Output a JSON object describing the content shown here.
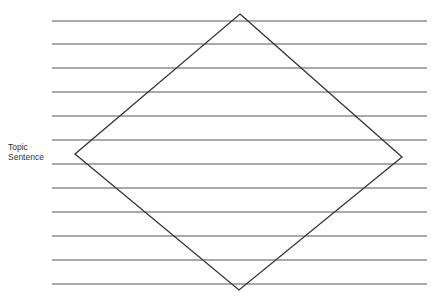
{
  "label": {
    "line1": "Topic",
    "line2": "Sentence"
  },
  "lines": {
    "x_start": 52,
    "x_end": 427,
    "y": [
      21,
      44,
      68,
      92,
      116,
      140,
      164,
      188,
      212,
      236,
      260,
      284
    ],
    "color": "#555555"
  },
  "diamond": {
    "top": [
      240,
      14
    ],
    "right": [
      402,
      157
    ],
    "bottom": [
      239,
      290
    ],
    "left": [
      75,
      154
    ],
    "color": "#333333"
  }
}
